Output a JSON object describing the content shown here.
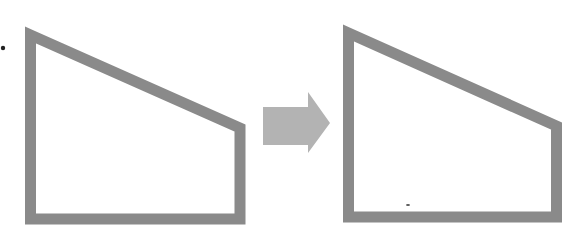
{
  "diagram": {
    "colors": {
      "background": "#ffffff",
      "shape_stroke": "#8a8a8a",
      "shape_fill": "#ffffff",
      "arrow_fill": "#b3b3b3",
      "marker": "#222222"
    },
    "stroke_width": 11,
    "shapes": [
      {
        "id": "before-shape",
        "type": "trapezoid-outline",
        "points": "30.5,35 240,128 240,219 30.5,219"
      },
      {
        "id": "after-shape",
        "type": "trapezoid-outline",
        "points": "348.5,33 556.5,126 556.5,217 348.5,217"
      }
    ],
    "arrow": {
      "direction": "right",
      "points": "263,107 308,107 308,92 330,123 308,153 308,145 263,145"
    },
    "markers": [
      {
        "id": "bullet-dot",
        "cx": 3,
        "cy": 48,
        "r": 2.2
      },
      {
        "id": "stray-mark",
        "cx": 408,
        "cy": 205,
        "r": 1.2
      }
    ]
  }
}
